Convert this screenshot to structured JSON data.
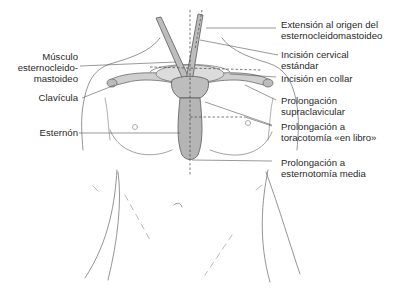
{
  "figure": {
    "colors": {
      "outline": "#6a6a6a",
      "bone_fill": "#c8c8c8",
      "bone_shade": "#9a9a9a",
      "leader": "#555555",
      "text": "#2a2a2a"
    }
  },
  "labels_left": [
    {
      "id": "musculo",
      "lines": [
        "Músculo",
        "esternocleido-",
        "mastoideo"
      ]
    },
    {
      "id": "clavicula",
      "lines": [
        "Clavícula"
      ]
    },
    {
      "id": "esternon",
      "lines": [
        "Esternón"
      ]
    }
  ],
  "labels_right": [
    {
      "id": "extension",
      "lines": [
        "Extensión al origen del",
        "esternocleidomastoideo"
      ]
    },
    {
      "id": "cervical",
      "lines": [
        "Incisión cervical",
        "estándar"
      ]
    },
    {
      "id": "collar",
      "lines": [
        "Incisión en collar"
      ]
    },
    {
      "id": "supraclavicular",
      "lines": [
        "Prolongación",
        "supraclavicular"
      ]
    },
    {
      "id": "toracotomia",
      "lines": [
        "Prolongación a",
        "toracotomía «en libro»"
      ]
    },
    {
      "id": "esternotomia",
      "lines": [
        "Prolongación a",
        "esternotomía media"
      ]
    }
  ]
}
